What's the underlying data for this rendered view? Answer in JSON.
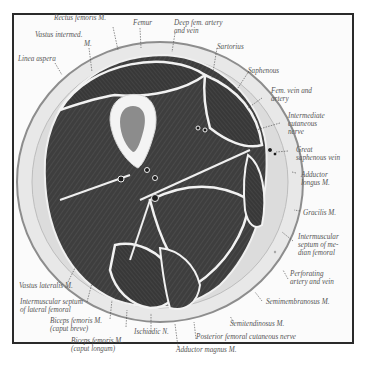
{
  "figure": {
    "type": "anatomical cross-section",
    "colors": {
      "muscle": "#3c3c3c",
      "fat": "#e6e6e6",
      "bone_marrow": "#8a8a8a",
      "cortex": "#f3f3f3",
      "frame": "#2a2a2a",
      "label_text": "#555555"
    }
  },
  "labels": {
    "rectus_femoris": "Rectus femoris M.",
    "vastus_intermed_1": "Vastus intermed.",
    "vastus_intermed_2": "M.",
    "femur": "Femur",
    "deep_fem_1": "Deep fem. artery",
    "deep_fem_2": "and vein",
    "linea_aspera": "Linea aspera",
    "sartorius": "Sartorius",
    "saphenous": "Saphenous",
    "fem_vein_1": "Fem. vein and",
    "fem_vein_2": "artery",
    "intermediate_1": "Intermediate",
    "intermediate_2": "cutaneous",
    "intermediate_3": "nerve",
    "great_saph_1": "Great",
    "great_saph_2": "saphenous vein",
    "adductor_longus_1": "Adductor",
    "adductor_longus_2": "longus M.",
    "gracilis": "Gracilis M.",
    "im_median_1": "Intermuscular",
    "im_median_2": "septum of me-",
    "im_median_3": "dian femoral",
    "perforating_1": "Perforating",
    "perforating_2": "artery and vein",
    "semimembranosus": "Semimembranosus M.",
    "semitendinosus": "Semitendinosus M.",
    "post_fem_cut": "Posterior femoral cutaneous nerve",
    "adductor_magnus": "Adductor magnus M.",
    "ischiadic": "Ischiadic N.",
    "biceps_longum_1": "Biceps femoris M.",
    "biceps_longum_2": "(caput longum)",
    "biceps_breve_1": "Biceps femoris M.",
    "biceps_breve_2": "(caput breve)",
    "im_lateral_1": "Intermuscular septum",
    "im_lateral_2": "of lateral femoral",
    "vastus_lateralis": "Vastus lateralis M."
  }
}
